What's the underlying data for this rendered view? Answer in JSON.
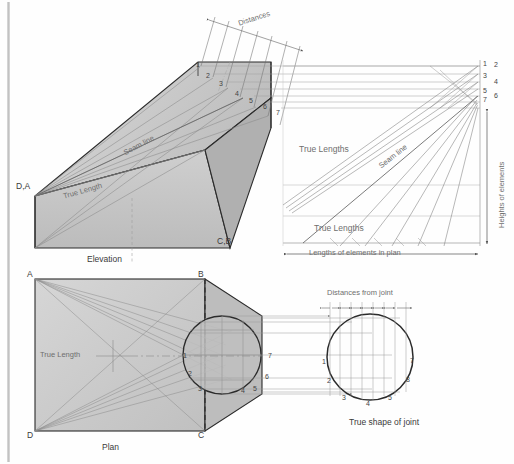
{
  "figure": {
    "type": "engineering-orthographic-projection"
  },
  "elevation": {
    "caption": "Elevation",
    "corner_left": "D,A",
    "corner_right": "C,B",
    "true_length_label": "True Length",
    "seam_line_label": "Seam line",
    "distances_label": "Distances",
    "edge_points": [
      "1",
      "2",
      "3",
      "4",
      "5",
      "6",
      "7"
    ]
  },
  "construction": {
    "true_lengths_upper": "True Lengths",
    "true_lengths_lower": "True Lengths",
    "seam_line_label": "Seam line",
    "vertical_axis_label": "Heights of elements",
    "horizontal_axis_label": "Lengths of elements in plan",
    "height_points_left": [
      "1",
      "3",
      "5",
      "7"
    ],
    "height_points_right": [
      "2",
      "4",
      "6"
    ]
  },
  "plan": {
    "caption": "Plan",
    "corner_a": "A",
    "corner_b": "B",
    "corner_c": "C",
    "corner_d": "D",
    "true_length_label": "True Length",
    "circle_points": [
      "1",
      "2",
      "3",
      "4",
      "5",
      "6",
      "7"
    ]
  },
  "true_shape": {
    "caption": "True shape of joint",
    "distances_label": "Distances from joint",
    "circle_points": [
      "1",
      "2",
      "3",
      "4",
      "5",
      "7",
      "8"
    ]
  },
  "colors": {
    "line_dark": "#2b2b2b",
    "line_mid": "#7b7b7b",
    "line_light": "#b4b4b4",
    "fill_light": "#d8d8d8",
    "fill_mid": "#c4c4c4",
    "fill_dark": "#a9a9a9",
    "text": "#3a3a3a",
    "background": "#ffffff",
    "margin_bar": "#bdbdbd"
  }
}
